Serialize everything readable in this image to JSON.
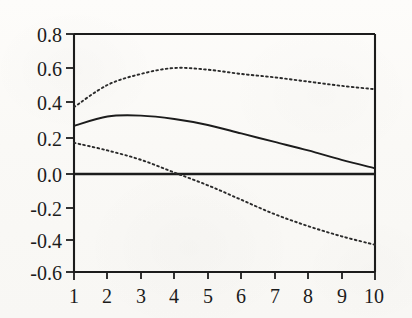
{
  "chart_data": {
    "type": "line",
    "title": "",
    "subtitle": "",
    "xlabel": "",
    "ylabel": "",
    "xlim": [
      1,
      10
    ],
    "ylim": [
      -0.6,
      0.8
    ],
    "grid": false,
    "legend_position": "none",
    "x_ticks": [
      "1",
      "2",
      "3",
      "4",
      "5",
      "6",
      "7",
      "8",
      "9",
      "10"
    ],
    "y_ticks": [
      "0.8",
      "0.6",
      "0.4",
      "0.2",
      "0.0",
      "-0.2",
      "-0.4",
      "-0.6"
    ],
    "x": [
      1,
      2,
      3,
      4,
      5,
      6,
      7,
      8,
      9,
      10
    ],
    "zero_line": 0.0,
    "series": [
      {
        "name": "point-estimate",
        "style": "solid",
        "color": "#1c1c1c",
        "values": [
          0.26,
          0.315,
          0.32,
          0.3,
          0.265,
          0.215,
          0.165,
          0.115,
          0.06,
          0.01
        ]
      },
      {
        "name": "upper-confidence-band",
        "style": "dotted",
        "color": "#2a2a2a",
        "values": [
          0.37,
          0.5,
          0.565,
          0.6,
          0.59,
          0.565,
          0.545,
          0.52,
          0.495,
          0.475
        ]
      },
      {
        "name": "lower-confidence-band",
        "style": "dotted",
        "color": "#2a2a2a",
        "values": [
          0.16,
          0.115,
          0.06,
          -0.015,
          -0.09,
          -0.175,
          -0.26,
          -0.33,
          -0.39,
          -0.44
        ]
      }
    ],
    "annotations": []
  }
}
